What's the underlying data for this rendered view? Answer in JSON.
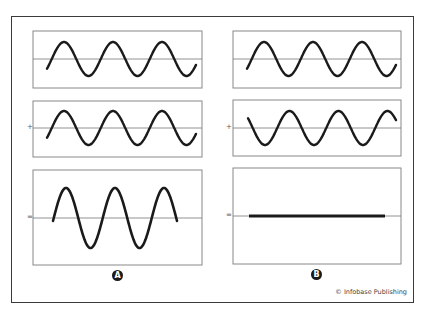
{
  "figure": {
    "credit": "© Infobase Publishing",
    "columns": [
      {
        "label": "A",
        "name": "constructive-interference",
        "operators": [
          "+",
          "="
        ],
        "panels": [
          {
            "role": "wave-1",
            "phase": "in-phase",
            "amplitude": 1
          },
          {
            "role": "wave-2",
            "phase": "in-phase",
            "amplitude": 1
          },
          {
            "role": "sum",
            "amplitude": 2
          }
        ]
      },
      {
        "label": "B",
        "name": "destructive-interference",
        "operators": [
          "+",
          "="
        ],
        "panels": [
          {
            "role": "wave-1",
            "phase": "in-phase",
            "amplitude": 1
          },
          {
            "role": "wave-2",
            "phase": "inverted",
            "amplitude": 1
          },
          {
            "role": "sum",
            "amplitude": 0
          }
        ]
      }
    ]
  },
  "colors": {
    "wave": "#1a1a1a",
    "axis": "#777777",
    "panel_border": "#888888",
    "frame": "#3a3a3a"
  }
}
